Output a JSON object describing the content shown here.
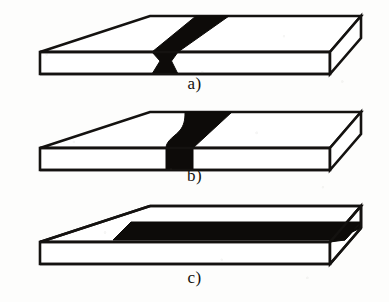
{
  "figure": {
    "background_color": "#fdfdfc",
    "line_color": "#141210",
    "fill_color": "#ffffff",
    "defect_color": "#0d0b09",
    "panels": [
      {
        "id": "a",
        "caption": "a)",
        "description": "Isometric rectangular plate with an inclined through-thickness band crossing the top face diagonally and pinching to a narrow waist at the front edge",
        "defect_name": "inclined-through-band",
        "plate": {
          "top_face": "150,16 361,16 330,52 40,52",
          "front_face": "40,52 330,52 330,74 40,74",
          "end_face": "330,52 330,74 361,38 361,16"
        },
        "defect": {
          "top_band": "196,16 229,16 178,52 152,52",
          "front_band": "152,52 178,52 172,60 178,74 152,74 160,60"
        }
      },
      {
        "id": "b",
        "caption": "b)",
        "description": "Isometric rectangular plate with a funnel shaped band: concave curved left flank and straight inclined right flank on the top face, narrowing to a vertical band on the front face",
        "defect_name": "funnel-shaped-band",
        "plate": {
          "top_face": "150,16 361,16 330,52 40,52",
          "front_face": "40,52 330,52 330,74 40,74",
          "end_face": "330,52 330,74 361,38 361,16"
        },
        "defect": {
          "top_band": "185,16 232,16 193,52 166,52",
          "front_band": "166,52 193,52 193,74 166,74"
        }
      },
      {
        "id": "c",
        "caption": "c)",
        "description": "Isometric rectangular plate with a longitudinal band running the full length of the top face parallel to the front edge, emerging as a triangular wedge on the right end face",
        "defect_name": "longitudinal-band",
        "plate": {
          "top_face": "150,14 361,14 330,50 40,50",
          "front_face": "40,50 330,50 330,72 40,72",
          "end_face": "330,50 330,72 361,36 361,14"
        },
        "defect": {
          "top_band": "131,30 361,30 345,48 113,48",
          "end_wedge": "345,48 361,30 361,36 330,50"
        }
      }
    ]
  }
}
